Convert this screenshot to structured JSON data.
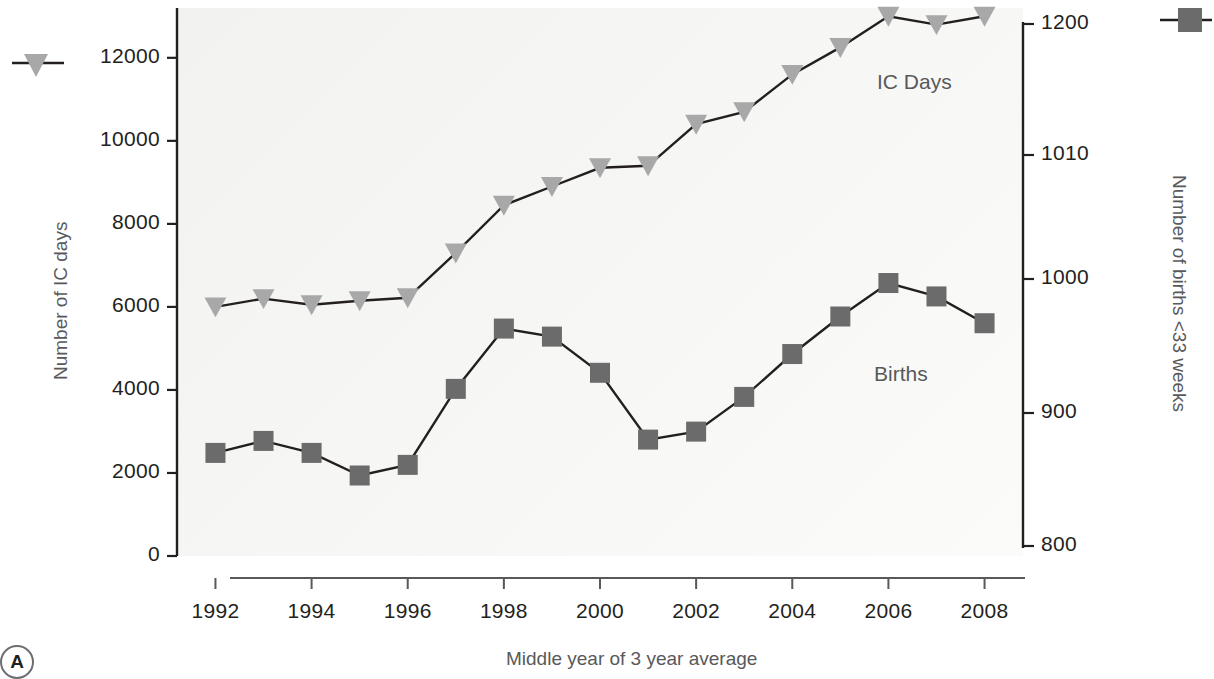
{
  "panel": {
    "label": "A"
  },
  "axes": {
    "left": {
      "title": "Number of IC days",
      "ticks": [
        "12000",
        "10000",
        "8000",
        "6000",
        "4000",
        "2000",
        "0"
      ],
      "tick_values": [
        12000,
        10000,
        8000,
        6000,
        4000,
        2000,
        0
      ]
    },
    "right": {
      "title": "Number of births <33 weeks",
      "ticks": [
        "1200",
        "1010",
        "1000",
        "900",
        "800"
      ],
      "tick_values": [
        1200,
        1010,
        1000,
        900,
        800
      ]
    },
    "bottom": {
      "title": "Middle year of 3 year average",
      "ticks": [
        "1992",
        "1994",
        "1996",
        "1998",
        "2000",
        "2002",
        "2004",
        "2006",
        "2008"
      ]
    }
  },
  "series_labels": {
    "ic_days": "IC Days",
    "births": "Births"
  },
  "legend": {
    "ic_days_marker": "triangle-down-marker",
    "births_marker": "square-marker"
  },
  "colors": {
    "ic_days": "#a8a8a8",
    "births": "#6b6b6b",
    "line": "#231f20",
    "text": "#231f20",
    "muted_text": "#58595b",
    "plot_background": "#f4f4f2"
  },
  "chart_data": {
    "type": "line",
    "title": "",
    "xlabel": "Middle year of 3 year average",
    "ylabel": "Number of IC days",
    "y2label": "Number of births <33 weeks",
    "grid": false,
    "legend_position": "inline",
    "x": [
      1992,
      1993,
      1994,
      1995,
      1996,
      1997,
      1998,
      1999,
      2000,
      2001,
      2002,
      2003,
      2004,
      2005,
      2006,
      2007,
      2008
    ],
    "xlim": [
      1991.2,
      2008.8
    ],
    "ylim": [
      0,
      13200
    ],
    "y2lim": [
      800,
      1200
    ],
    "series": [
      {
        "name": "IC Days",
        "axis": "left",
        "marker": "triangle-down",
        "color": "#a8a8a8",
        "values": [
          6000,
          6200,
          6050,
          6150,
          6220,
          7300,
          8450,
          8900,
          9350,
          9400,
          10400,
          10700,
          11600,
          12250,
          13000,
          12800,
          13000
        ]
      },
      {
        "name": "Births",
        "axis": "right",
        "marker": "square",
        "color": "#6b6b6b",
        "values": [
          870,
          879,
          870,
          853,
          861,
          918,
          963,
          957,
          930,
          880,
          886,
          912,
          944,
          972,
          997,
          987,
          967
        ]
      }
    ],
    "series_left_scale_equivalent": {
      "note": "Births plotted against right axis; left-axis pixel equivalents",
      "values": [
        2050,
        2330,
        2050,
        1570,
        1760,
        3200,
        4650,
        4500,
        3830,
        2400,
        2580,
        3420,
        4430,
        5170,
        5820,
        5580,
        5140
      ]
    }
  }
}
